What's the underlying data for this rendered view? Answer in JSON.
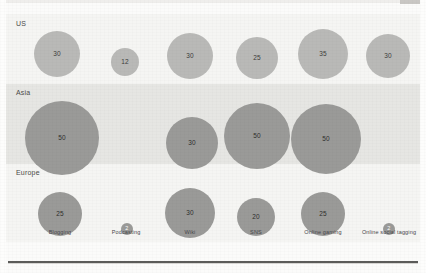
{
  "chart_data": {
    "type": "bubble",
    "title": "",
    "xlabel": "",
    "ylabel": "",
    "grid": false,
    "legend_position": "none",
    "categories": [
      "Blogging",
      "Podcasting",
      "Wiki",
      "SNS",
      "Online gaming",
      "Online social tagging"
    ],
    "rows": [
      "US",
      "Asia",
      "Europe"
    ],
    "series": [
      {
        "name": "US",
        "values": [
          30,
          12,
          30,
          25,
          35,
          30
        ]
      },
      {
        "name": "Asia",
        "values": [
          50,
          null,
          30,
          50,
          50,
          null
        ]
      },
      {
        "name": "Europe",
        "values": [
          25,
          2,
          30,
          20,
          25,
          2
        ]
      }
    ],
    "bubbles": [
      {
        "row": "US",
        "category": "Blogging",
        "value": 30,
        "label": "30",
        "cx": 51,
        "cy": 40,
        "r": 23,
        "color": "#b9b9b7",
        "tone": "light"
      },
      {
        "row": "US",
        "category": "Podcasting",
        "value": 12,
        "label": "12",
        "cx": 119,
        "cy": 48,
        "r": 14,
        "color": "#b9b9b7",
        "tone": "light"
      },
      {
        "row": "US",
        "category": "Wiki",
        "value": 30,
        "label": "30",
        "cx": 184,
        "cy": 42,
        "r": 23,
        "color": "#b9b9b7",
        "tone": "light"
      },
      {
        "row": "US",
        "category": "SNS",
        "value": 25,
        "label": "25",
        "cx": 251,
        "cy": 44,
        "r": 21,
        "color": "#b9b9b7",
        "tone": "light"
      },
      {
        "row": "US",
        "category": "Online gaming",
        "value": 35,
        "label": "35",
        "cx": 317,
        "cy": 40,
        "r": 25,
        "color": "#b9b9b7",
        "tone": "light"
      },
      {
        "row": "US",
        "category": "Online social tagging",
        "value": 30,
        "label": "30",
        "cx": 382,
        "cy": 42,
        "r": 22,
        "color": "#b9b9b7",
        "tone": "light"
      },
      {
        "row": "Asia",
        "category": "Blogging",
        "value": 50,
        "label": "50",
        "cx": 56,
        "cy": 124,
        "r": 37,
        "color": "#9a9a98",
        "tone": "dark"
      },
      {
        "row": "Asia",
        "category": "Wiki",
        "value": 30,
        "label": "30",
        "cx": 186,
        "cy": 129,
        "r": 26,
        "color": "#9a9a98",
        "tone": "dark"
      },
      {
        "row": "Asia",
        "category": "SNS",
        "value": 50,
        "label": "50",
        "cx": 251,
        "cy": 122,
        "r": 33,
        "color": "#9a9a98",
        "tone": "dark"
      },
      {
        "row": "Asia",
        "category": "Online gaming",
        "value": 50,
        "label": "50",
        "cx": 320,
        "cy": 125,
        "r": 35,
        "color": "#9a9a98",
        "tone": "dark"
      },
      {
        "row": "Europe",
        "category": "Blogging",
        "value": 25,
        "label": "25",
        "cx": 54,
        "cy": 200,
        "r": 22,
        "color": "#9a9a98",
        "tone": "dark"
      },
      {
        "row": "Europe",
        "category": "Podcasting",
        "value": 2,
        "label": "2",
        "cx": 121,
        "cy": 215,
        "r": 6,
        "color": "#9a9a98",
        "tone": "tiny"
      },
      {
        "row": "Europe",
        "category": "Wiki",
        "value": 30,
        "label": "30",
        "cx": 184,
        "cy": 199,
        "r": 25,
        "color": "#9a9a98",
        "tone": "dark"
      },
      {
        "row": "Europe",
        "category": "SNS",
        "value": 20,
        "label": "20",
        "cx": 250,
        "cy": 203,
        "r": 19,
        "color": "#9a9a98",
        "tone": "dark"
      },
      {
        "row": "Europe",
        "category": "Online gaming",
        "value": 25,
        "label": "25",
        "cx": 317,
        "cy": 200,
        "r": 22,
        "color": "#9a9a98",
        "tone": "dark"
      },
      {
        "row": "Europe",
        "category": "Online social tagging",
        "value": 2,
        "label": "2",
        "cx": 383,
        "cy": 215,
        "r": 6,
        "color": "#9a9a98",
        "tone": "tiny"
      }
    ],
    "category_positions": [
      54,
      120,
      184,
      250,
      317,
      383
    ],
    "colors": {
      "bubble_light": "#b9b9b7",
      "bubble_dark": "#9a9a98",
      "band_light": "#f5f5f3",
      "band_dark": "#e6e6e3",
      "rule": "#5b5b59",
      "label_text": "#46464a"
    }
  },
  "bands": [
    {
      "name": "US",
      "label": "US"
    },
    {
      "name": "Asia",
      "label": "Asia"
    },
    {
      "name": "Europe",
      "label": "Europe"
    }
  ]
}
